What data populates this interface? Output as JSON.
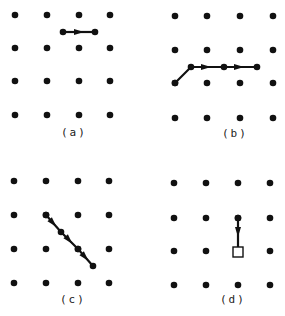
{
  "figure": {
    "panels": [
      {
        "id": "a",
        "label": "(a)",
        "label_pos": [
          61,
          136
        ],
        "grid_x": [
          15,
          47,
          79,
          110
        ],
        "grid_y": [
          15,
          48,
          81,
          115
        ],
        "path": [
          [
            63,
            32
          ],
          [
            95,
            32
          ]
        ],
        "arrows": [
          [
            79,
            32,
            0
          ]
        ],
        "end_marker": "dot"
      },
      {
        "id": "b",
        "label": "(b)",
        "label_pos": [
          222,
          137
        ],
        "grid_x": [
          175,
          207,
          240,
          273
        ],
        "grid_y": [
          16,
          50,
          83,
          118
        ],
        "path": [
          [
            175,
            83
          ],
          [
            191,
            67
          ],
          [
            224,
            67
          ],
          [
            257,
            67
          ]
        ],
        "arrows": [
          [
            206,
            67,
            0
          ],
          [
            239,
            67,
            0
          ]
        ],
        "end_marker": "dot"
      },
      {
        "id": "c",
        "label": "(c)",
        "label_pos": [
          60,
          303
        ],
        "grid_x": [
          14,
          46,
          78,
          109
        ],
        "grid_y": [
          181,
          215,
          249,
          283
        ],
        "path": [
          [
            46,
            215
          ],
          [
            61,
            232
          ],
          [
            78,
            249
          ],
          [
            93,
            266
          ]
        ],
        "arrows": [
          [
            53,
            223,
            48
          ],
          [
            69,
            240,
            48
          ],
          [
            85,
            257,
            48
          ]
        ],
        "end_marker": "dot"
      },
      {
        "id": "d",
        "label": "(d)",
        "label_pos": [
          220,
          303
        ],
        "grid_x": [
          174,
          206,
          238,
          270
        ],
        "grid_y": [
          183,
          218,
          251,
          285
        ],
        "path": [
          [
            238,
            218
          ],
          [
            238,
            252
          ]
        ],
        "arrows": [
          [
            238,
            232,
            90
          ]
        ],
        "end_marker": "square"
      }
    ],
    "colors": {
      "ink": "#111111",
      "background": "#ffffff"
    }
  }
}
